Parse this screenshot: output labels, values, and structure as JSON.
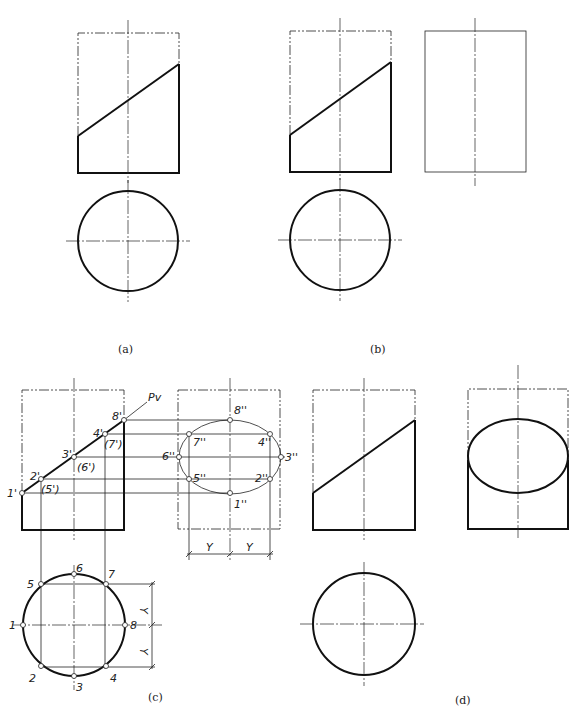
{
  "figure": {
    "subfigures": [
      {
        "id": "a",
        "caption": "(a)"
      },
      {
        "id": "b",
        "caption": "(b)"
      },
      {
        "id": "c",
        "caption": "(c)"
      },
      {
        "id": "d",
        "caption": "(d)"
      }
    ]
  },
  "labels": {
    "cutting_plane": "Pv",
    "front_points": [
      "1'",
      "2'",
      "(5')",
      "3'",
      "(6')",
      "4'",
      "(7')",
      "8'"
    ],
    "side_points": [
      "8''",
      "7''",
      "4''",
      "6''",
      "3''",
      "5''",
      "2''",
      "1''"
    ],
    "top_points": [
      "1",
      "2",
      "3",
      "4",
      "5",
      "6",
      "7",
      "8"
    ],
    "dimension": "Y"
  }
}
